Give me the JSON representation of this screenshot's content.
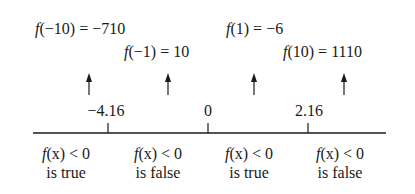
{
  "diagram": {
    "type": "sign-chart number line",
    "test_values": [
      {
        "fn": "f",
        "arg": "(−10)",
        "rest": " = −710",
        "x": 35,
        "y": 20
      },
      {
        "fn": "f",
        "arg": "(−1)",
        "rest": " = 10",
        "x": 124,
        "y": 43
      },
      {
        "fn": "f",
        "arg": "(1)",
        "rest": " = −6",
        "x": 226,
        "y": 20
      },
      {
        "fn": "f",
        "arg": "(10)",
        "rest": " = 1110",
        "x": 283,
        "y": 43
      }
    ],
    "tick_labels": [
      {
        "label": "−4.16",
        "x": 108
      },
      {
        "label": "0",
        "x": 208
      },
      {
        "label": "2.16",
        "x": 308
      }
    ],
    "regions": [
      {
        "condition_fn": "f",
        "condition_arg": "(x)",
        "condition_rest": " < 0",
        "result": "is true",
        "x": 66
      },
      {
        "condition_fn": "f",
        "condition_arg": "(x)",
        "condition_rest": " < 0",
        "result": "is false",
        "x": 158
      },
      {
        "condition_fn": "f",
        "condition_arg": "(x)",
        "condition_rest": " < 0",
        "result": "is true",
        "x": 250
      },
      {
        "condition_fn": "f",
        "condition_arg": "(x)",
        "condition_rest": " < 0",
        "result": "is false",
        "x": 342
      }
    ],
    "colors": {
      "ink": "#1a1a1a",
      "background": "#ffffff"
    }
  }
}
